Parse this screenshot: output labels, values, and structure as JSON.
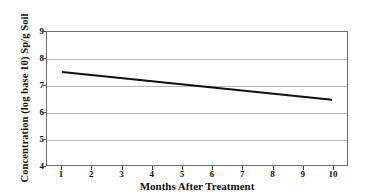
{
  "chart_data": {
    "type": "line",
    "title": "",
    "xlabel": "Months After Treatment",
    "ylabel": "Concentration (log base 10) Sp/g Soil",
    "x": [
      1,
      10
    ],
    "series": [
      {
        "name": "Concentration",
        "values": [
          7.5,
          6.45
        ],
        "color": "#111111"
      }
    ],
    "xlim": [
      0.5,
      10.5
    ],
    "ylim": [
      4,
      9
    ],
    "xticks": [
      1,
      2,
      3,
      4,
      5,
      6,
      7,
      8,
      9,
      10
    ],
    "xtick_labels": [
      "1",
      "2",
      "3",
      "4",
      "5",
      "6",
      "7",
      "8",
      "9",
      "10"
    ],
    "yticks": [
      4,
      5,
      6,
      7,
      8,
      9
    ],
    "ytick_labels": [
      "4",
      "5",
      "6",
      "7",
      "8",
      "9"
    ],
    "grid": "horizontal",
    "gridlines_at": [
      5,
      6,
      7,
      8
    ],
    "legend": "none",
    "frame": "box",
    "grid_color": "#b9b9b9",
    "frame_color": "#6f6f6f"
  }
}
